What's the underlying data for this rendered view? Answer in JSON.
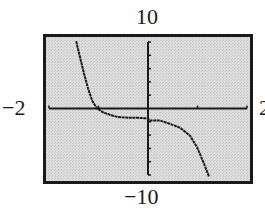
{
  "chart_data": {
    "type": "line",
    "title": "",
    "xlabel": "",
    "ylabel": "",
    "window": {
      "xmin": -2,
      "xmax": 2,
      "xscl": 1,
      "ymin": -10,
      "ymax": 10,
      "yscl": 2
    },
    "tick_labels": {
      "xmin": "−2",
      "xmax": "2",
      "ymin": "−10",
      "ymax": "10"
    },
    "grid": false,
    "legend": null,
    "series": [
      {
        "name": "f(x)",
        "x": [
          -1.45,
          -1.37,
          -1.29,
          -1.21,
          -1.13,
          -1.03,
          -0.9,
          -0.75,
          -0.6,
          -0.4,
          -0.2,
          0.0,
          0.04,
          0.24,
          0.44,
          0.65,
          0.85,
          0.99,
          1.11,
          1.23
        ],
        "y": [
          10.1,
          7.6,
          5.2,
          3.0,
          1.2,
          0.0,
          -0.6,
          -1.0,
          -1.3,
          -1.4,
          -1.4,
          -1.5,
          -1.8,
          -1.8,
          -2.3,
          -2.9,
          -4.1,
          -5.8,
          -7.9,
          -10.2
        ]
      }
    ]
  },
  "colors": {
    "screen_background": "#d6d6d6",
    "frame": "#1a1a1a",
    "axes": "#1a1a1a",
    "curve": "#1a1a1a"
  }
}
